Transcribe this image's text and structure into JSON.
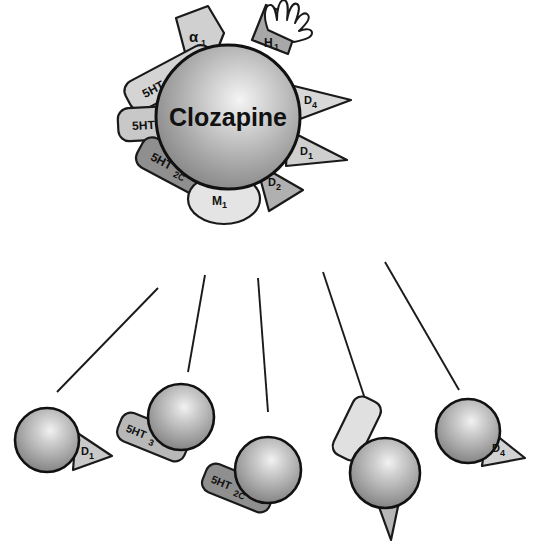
{
  "diagram": {
    "center": {
      "label": "Clozapine",
      "shape": "sphere",
      "colors": {
        "highlight": "#f0f0f0",
        "mid": "#b4b4b4",
        "edge": "#7a7a7a",
        "outline": "#1a1a1a"
      }
    },
    "receptors": [
      {
        "id": "alpha1",
        "label": "α",
        "sub": "1",
        "shape": "wedge",
        "fill": "#d0d0d0",
        "angle_deg": -108
      },
      {
        "id": "h1",
        "label": "H",
        "sub": "1",
        "shape": "bar",
        "fill": "#a8a8a8",
        "angle_deg": -68,
        "accent": "hand-flame"
      },
      {
        "id": "5ht2",
        "label": "5HT",
        "sub": "2",
        "shape": "rounded",
        "fill": "#d4d4d4",
        "angle_deg": -146
      },
      {
        "id": "5ht3",
        "label": "5HT",
        "sub": "3",
        "shape": "rounded",
        "fill": "#c8c8c8",
        "angle_deg": 180
      },
      {
        "id": "5ht2c",
        "label": "5HT",
        "sub": "2C",
        "shape": "rounded",
        "fill": "#8f8f8f",
        "angle_deg": 145
      },
      {
        "id": "m1",
        "label": "M",
        "sub": "1",
        "shape": "ellipse",
        "fill": "#e4e4e4",
        "angle_deg": 95
      },
      {
        "id": "d2",
        "label": "D",
        "sub": "2",
        "shape": "triangle",
        "fill": "#b0b0b0",
        "angle_deg": 58
      },
      {
        "id": "d1",
        "label": "D",
        "sub": "1",
        "shape": "triangle",
        "fill": "#cfcfcf",
        "angle_deg": 25
      },
      {
        "id": "d4",
        "label": "D",
        "sub": "4",
        "shape": "triangle",
        "fill": "#d8d8d8",
        "angle_deg": -10
      }
    ]
  },
  "targets": {
    "items": [
      {
        "id": "t-d1",
        "label": "D",
        "sub": "1",
        "shape": "triangle",
        "fill": "#c9c9c9"
      },
      {
        "id": "t-5ht3",
        "label": "5HT",
        "sub": "3",
        "shape": "rounded",
        "fill": "#b8b8b8"
      },
      {
        "id": "t-5ht2c",
        "label": "5HT",
        "sub": "2C",
        "shape": "rounded",
        "fill": "#8f8f8f"
      },
      {
        "id": "t-h1",
        "label": "",
        "sub": "",
        "shape": "bar-triangle",
        "fill": "#d9d9d9"
      },
      {
        "id": "t-d4",
        "label": "D",
        "sub": "4",
        "shape": "triangle",
        "fill": "#d2d2d2"
      }
    ],
    "connector_count": 5,
    "connector_color": "#1a1a1a"
  }
}
